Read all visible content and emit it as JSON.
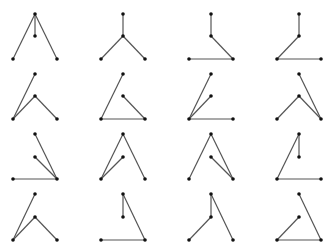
{
  "diagram": {
    "title": "",
    "colors": {
      "edge": "#555555",
      "node": "#111111",
      "background": "#ffffff"
    },
    "columns_x": [
      [
        13,
        35,
        57
      ],
      [
        101,
        123,
        145
      ],
      [
        189,
        211,
        233
      ],
      [
        277,
        299,
        321
      ]
    ],
    "rows_y": [
      [
        14,
        36,
        59
      ],
      [
        74,
        96,
        119
      ],
      [
        134,
        157,
        179
      ],
      [
        194,
        217,
        240
      ]
    ],
    "cells": [
      [
        [
          "T-M",
          "T-L",
          "T-R"
        ],
        [
          "T-M",
          "M-L",
          "M-R"
        ],
        [
          "T-M",
          "M-R",
          "L-R"
        ],
        [
          "T-M",
          "M-L",
          "L-R"
        ]
      ],
      [
        [
          "T-L",
          "M-L",
          "M-R"
        ],
        [
          "T-L",
          "M-R",
          "L-R"
        ],
        [
          "T-L",
          "M-L",
          "L-R"
        ],
        [
          "T-R",
          "M-L",
          "M-R"
        ]
      ],
      [
        [
          "T-R",
          "M-R",
          "L-R"
        ],
        [
          "T-L",
          "T-R",
          "M-L"
        ],
        [
          "T-L",
          "T-R",
          "M-R"
        ],
        [
          "T-M",
          "T-L",
          "L-R"
        ]
      ],
      [
        [
          "T-L",
          "M-L",
          "M-R"
        ],
        [
          "T-M",
          "T-R",
          "L-R"
        ],
        [
          "T-M",
          "T-R",
          "M-L"
        ],
        [
          "T-R",
          "M-L",
          "L-R"
        ]
      ]
    ]
  }
}
